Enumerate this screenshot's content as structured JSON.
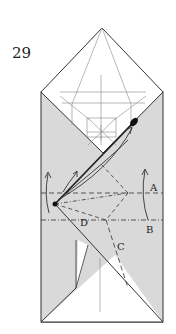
{
  "step": {
    "number": "29"
  },
  "labels": {
    "A": "A",
    "B": "B",
    "C": "C",
    "D": "D"
  },
  "colors": {
    "paper_shaded": "#d9d9d9",
    "paper_white": "#ffffff",
    "line": "#333333",
    "crease": "#888888"
  },
  "icons": {
    "valley_fold": "dashed-line",
    "mountain_fold": "dash-dot-line",
    "fold_arrow": "curved-arrow",
    "pivot_point": "black-dot"
  }
}
